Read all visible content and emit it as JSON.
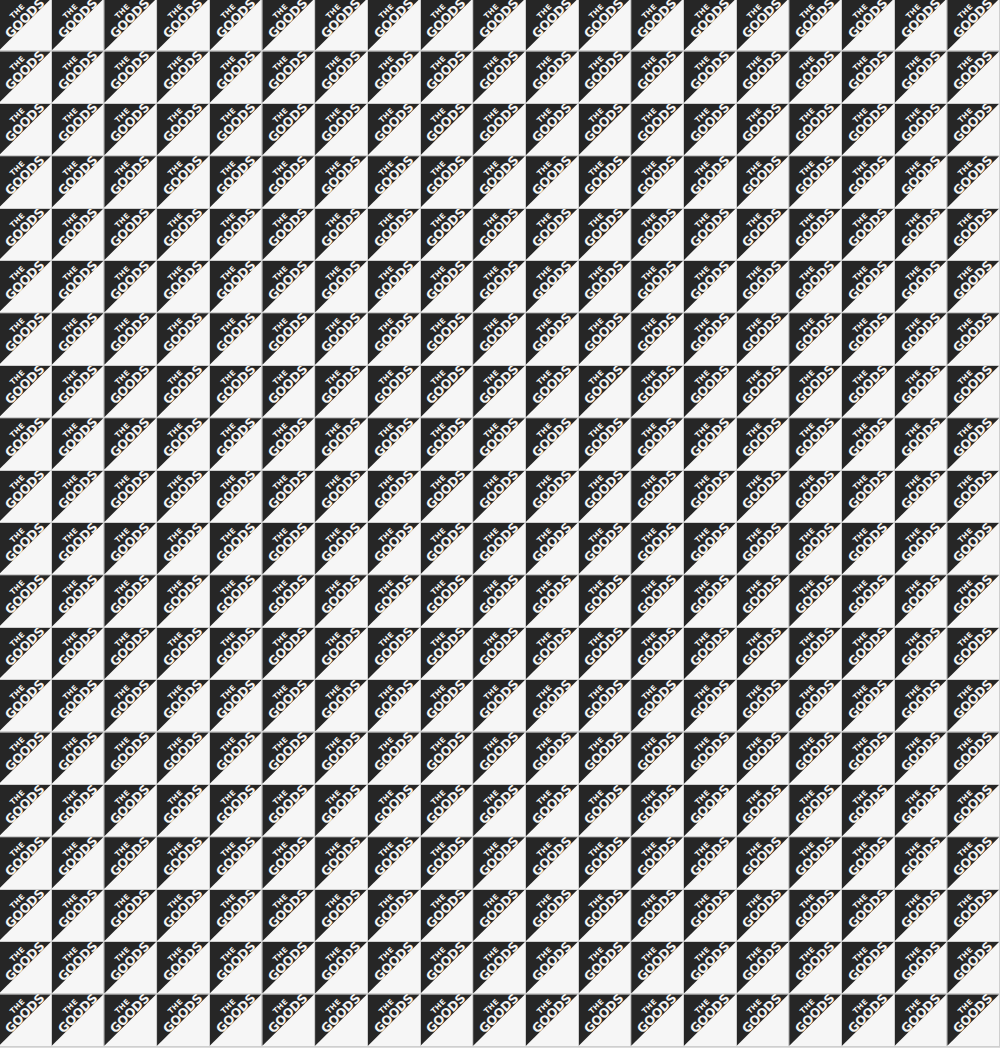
{
  "pattern": {
    "motif_line1": "THE",
    "motif_line2": "GOODS",
    "rows": 20,
    "columns": 19,
    "colors": {
      "dark": "#262626",
      "light": "#f6f6f6",
      "gap": "#cfcfcf"
    }
  }
}
